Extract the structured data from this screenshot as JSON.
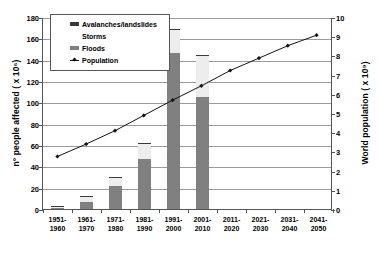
{
  "chart_data": {
    "type": "bar",
    "title": "",
    "subtitle": "",
    "xlabel": "",
    "ylabel": "n° people affected ( x 10⁶)",
    "y2label": "World population ( x 10⁹)",
    "ylim": [
      0,
      180
    ],
    "y2lim": [
      0,
      10
    ],
    "ytick_step": 20,
    "y2tick_step": 1,
    "grid": true,
    "legend_position": "top-left",
    "categories": [
      "1951-1960",
      "1961-1970",
      "1971-1980",
      "1981-1990",
      "1991-2000",
      "2001-2010",
      "2011-2020",
      "2021-2030",
      "2031-2040",
      "2041-2050"
    ],
    "category_lines": [
      [
        "1951-",
        "1960"
      ],
      [
        "1961-",
        "1970"
      ],
      [
        "1971-",
        "1980"
      ],
      [
        "1981-",
        "1990"
      ],
      [
        "1991-",
        "2000"
      ],
      [
        "2001-",
        "2010"
      ],
      [
        "2011-",
        "2020"
      ],
      [
        "2021-",
        "2030"
      ],
      [
        "2031-",
        "2040"
      ],
      [
        "2041-",
        "2050"
      ]
    ],
    "ytick_labels": [
      "0",
      "20",
      "40",
      "60",
      "80",
      "100",
      "120",
      "140",
      "160",
      "180"
    ],
    "ytick_values": [
      0,
      20,
      40,
      60,
      80,
      100,
      120,
      140,
      160,
      180
    ],
    "y2tick_labels": [
      "0",
      "1",
      "2",
      "3",
      "4",
      "5",
      "6",
      "7",
      "8",
      "9",
      "10"
    ],
    "y2tick_values": [
      0,
      1,
      2,
      3,
      4,
      5,
      6,
      7,
      8,
      9,
      10
    ],
    "series": [
      {
        "name": "Floods",
        "kind": "bar",
        "stack": "affected",
        "color": "#808080",
        "axis": "left",
        "values": [
          1,
          7,
          22,
          47,
          146,
          105,
          null,
          null,
          null,
          null
        ]
      },
      {
        "name": "Storms",
        "kind": "bar",
        "stack": "affected",
        "color": "#ededed",
        "axis": "left",
        "values": [
          0.5,
          4,
          7,
          14,
          22,
          38,
          null,
          null,
          null,
          null
        ]
      },
      {
        "name": "Avalanches/landslides",
        "kind": "bar",
        "stack": "affected",
        "color": "#3a3a3a",
        "axis": "left",
        "values": [
          0.2,
          0.3,
          0.4,
          0.5,
          0.6,
          0.6,
          null,
          null,
          null,
          null
        ]
      },
      {
        "name": "Population",
        "kind": "line",
        "color": "#111111",
        "axis": "right",
        "marker": "diamond",
        "values": [
          2.75,
          3.4,
          4.1,
          4.9,
          5.7,
          6.45,
          7.25,
          7.9,
          8.55,
          9.1
        ]
      }
    ],
    "stack_totals": [
      1.7,
      11.3,
      29.4,
      61.5,
      168.6,
      143.6,
      null,
      null,
      null,
      null
    ]
  },
  "legend": {
    "items": [
      {
        "label": "Avalanches/landslides",
        "swatch": "dark"
      },
      {
        "label": "Storms",
        "swatch": "blank"
      },
      {
        "label": "Floods",
        "swatch": "gray"
      },
      {
        "label": "Population",
        "swatch": "line"
      }
    ]
  }
}
